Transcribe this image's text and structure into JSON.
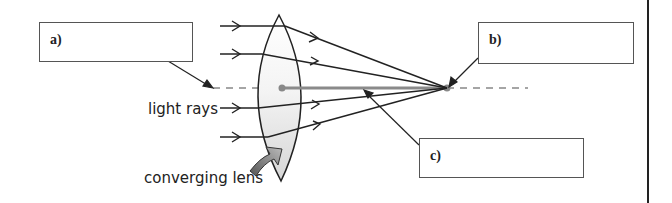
{
  "diagram": {
    "labels": {
      "light_rays": "light rays",
      "converging_lens": "converging lens"
    },
    "answer_boxes": [
      {
        "id": "a",
        "label": "a)",
        "value": ""
      },
      {
        "id": "b",
        "label": "b)",
        "value": ""
      },
      {
        "id": "c",
        "label": "c)",
        "value": ""
      }
    ],
    "colors": {
      "ray": "#222222",
      "axis": "#888888",
      "focal_line": "#8a8a8a",
      "lens_fill": "#e6e6e6",
      "arrow_gray": "#777777",
      "box_border": "#555555"
    }
  }
}
